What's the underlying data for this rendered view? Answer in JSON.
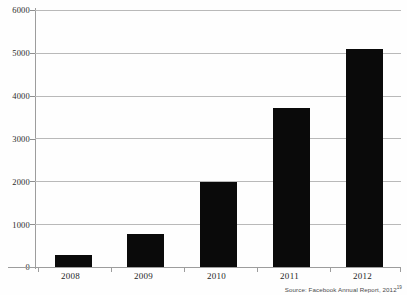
{
  "chart_data": {
    "type": "bar",
    "title": "",
    "subtitle": "",
    "xlabel": "",
    "ylabel": "",
    "categories": [
      "2008",
      "2009",
      "2010",
      "2011",
      "2012"
    ],
    "values": [
      272,
      777,
      1974,
      3711,
      5089
    ],
    "series": [
      {
        "name": "Facebook annual revenue (US$ millions)",
        "values": [
          272,
          777,
          1974,
          3711,
          5089
        ]
      }
    ],
    "ylim": [
      0,
      6000
    ],
    "yticks": [
      0,
      1000,
      2000,
      3000,
      4000,
      5000,
      6000
    ],
    "ytick_labels": [
      "0",
      "1000",
      "2000",
      "3000",
      "4000",
      "5000",
      "6000"
    ],
    "grid": true,
    "legend": false,
    "bar_color": "#0a0a0a",
    "gridline_color": "#b9b9b9",
    "axis_color": "#9d9d9d",
    "background_color": "#ffffff"
  },
  "annotations": {
    "source_prefix": "Source: Facebook Annual Report, 2012",
    "source_footnote_marker": "19"
  }
}
